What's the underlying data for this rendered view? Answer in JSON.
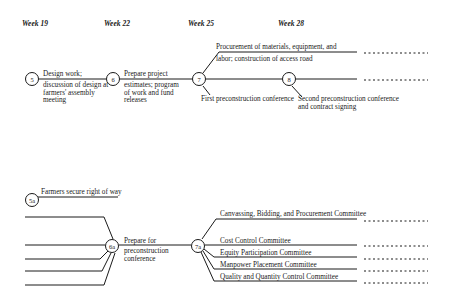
{
  "weeks": [
    "Week 19",
    "Week 22",
    "Week 25",
    "Week 28"
  ],
  "top": {
    "nodes": [
      "5",
      "6",
      "7",
      "8"
    ],
    "activity_5_6": {
      "line1": "Design work;",
      "line2": "discussion of design at",
      "line3": "farmers' assembly",
      "line4": "meeting"
    },
    "activity_6_7": {
      "line1": "Prepare project",
      "line2": "estimates; program",
      "line3": "of work and fund",
      "line4": "releases"
    },
    "branch_up": {
      "line1": "Procurement of materials, equipment, and",
      "line2": "labor; construction of access road"
    },
    "branch_down_7": "First preconstruction conference",
    "branch_down_8": {
      "line1": "Second preconstruction conference",
      "line2": "and contract signing"
    }
  },
  "bottom": {
    "nodes": [
      "5a",
      "6a",
      "7a"
    ],
    "activity_5a": "Farmers secure right of way",
    "activity_6a_7a": {
      "line1": "Prepare for",
      "line2": "preconstruction",
      "line3": "conference"
    },
    "committees": [
      "Canvassing, Bidding, and Procurement Committee",
      "Cost Control Committee",
      "Equity Participation Committee",
      "Manpower Placement Committee",
      "Quality and Quantity Control Committee"
    ]
  }
}
